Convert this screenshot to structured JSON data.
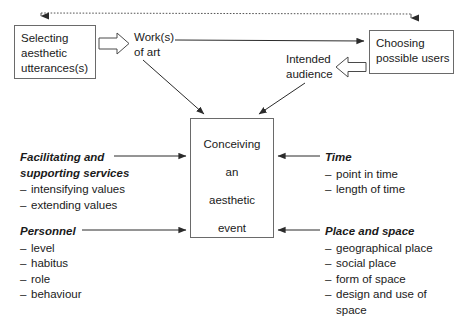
{
  "diagram": {
    "colors": {
      "stroke": "#333333",
      "box_border": "#6a6a6a",
      "text": "#1a1a1a",
      "background": "#ffffff"
    },
    "nodes": {
      "selecting": {
        "lines": [
          "Selecting",
          "aesthetic",
          "utterances(s)"
        ]
      },
      "works_of_art": {
        "lines": [
          "Work(s)",
          "of art"
        ]
      },
      "intended_audience": {
        "lines": [
          "Intended",
          "audience"
        ]
      },
      "choosing": {
        "lines": [
          "Choosing",
          "possible users"
        ]
      },
      "conceiving": {
        "lines": [
          "Conceiving",
          "an",
          "aesthetic",
          "event"
        ]
      }
    },
    "clusters": {
      "facilitating": {
        "heading_line1": "Facilitating and",
        "heading_line2": "supporting services",
        "items": [
          "intensifying values",
          "extending values"
        ]
      },
      "personnel": {
        "heading": "Personnel",
        "items": [
          "level",
          "habitus",
          "role",
          "behaviour"
        ]
      },
      "time": {
        "heading": "Time",
        "items": [
          "point in time",
          "length of time"
        ]
      },
      "place": {
        "heading": "Place and space",
        "items": [
          "geographical place",
          "social place",
          "form of space",
          "design and use of space"
        ]
      }
    },
    "connectors": {
      "dotted_top": "feedback-loop-dotted",
      "block_arrow_right": "selecting-to-works",
      "block_arrow_left": "choosing-to-audience",
      "works_to_choosing": "solid-arrow-right",
      "works_to_conceiving": "solid-arrow-diagonal",
      "audience_to_conceiving": "solid-arrow-diagonal",
      "facilitating_to_conceiving": "solid-arrow-right",
      "personnel_to_conceiving": "solid-arrow-right",
      "time_to_conceiving": "solid-arrow-left",
      "place_to_conceiving": "solid-arrow-left"
    }
  }
}
